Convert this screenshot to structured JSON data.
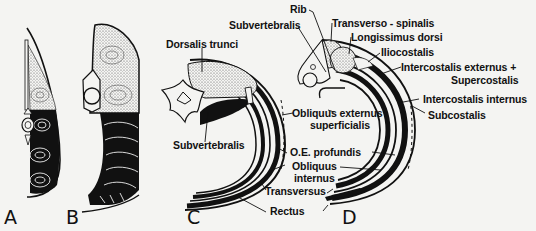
{
  "figure": {
    "panels": [
      {
        "id": "A",
        "letter": "A"
      },
      {
        "id": "B",
        "letter": "B"
      },
      {
        "id": "C",
        "letter": "C"
      },
      {
        "id": "D",
        "letter": "D"
      }
    ],
    "panel_C_labels": {
      "dorsalis_trunci": "Dorsalis trunci",
      "subvertebralis": "Subvertebralis",
      "obliquus_externus": "Obliquus externus",
      "superficialis": "superficialis",
      "oe_profundis": "O.E. profundis",
      "obliquus": "Obliquus",
      "internus": "internus",
      "transversus": "Transversus",
      "rectus": "Rectus"
    },
    "panel_D_labels": {
      "rib": "Rib",
      "subvertebralis": "Subvertebralis",
      "transverso_spinalis": "Transverso - spinalis",
      "longissimus_dorsi": "Longissimus dorsi",
      "iliocostalis": "Iliocostalis",
      "intercostalis_externus": "Intercostalis externus +",
      "supercostalis": "Supercostalis",
      "intercostalis_internus": "Intercostalis internus",
      "subcostalis": "Subcostalis"
    },
    "colors": {
      "ink": "#111111",
      "paper": "#f4f4f2",
      "stipple": "#cfcfca"
    }
  }
}
